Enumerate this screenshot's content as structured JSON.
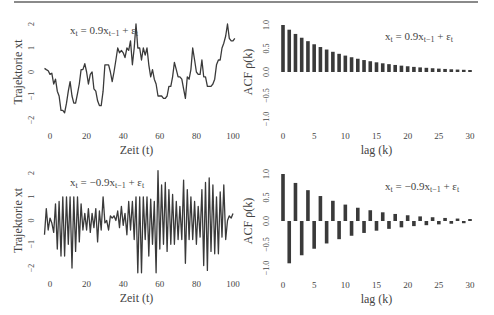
{
  "page": {
    "rule_color": "#8a8a8a",
    "line_color": "#3a3a3a",
    "bar_color": "#3a3a3a"
  },
  "chart_data": [
    {
      "type": "line",
      "title": "x_t = 0.9x_{t−1} + ε_t",
      "annotation": "xt = 0.9xt−1 + εt",
      "xlabel": "Zeit (t)",
      "ylabel": "Trajektorie xt",
      "xticks": [
        0,
        20,
        40,
        60,
        80,
        100
      ],
      "yticks": [
        -2,
        -1,
        0,
        1,
        2
      ],
      "xlim": [
        -5,
        105
      ],
      "ylim": [
        -2.2,
        2.2
      ],
      "x": [
        -3,
        -2,
        -1,
        0,
        1,
        2,
        3,
        4,
        5,
        6,
        7,
        8,
        9,
        10,
        11,
        12,
        13,
        14,
        15,
        16,
        17,
        18,
        19,
        20,
        21,
        22,
        23,
        24,
        25,
        26,
        27,
        28,
        29,
        30,
        31,
        32,
        33,
        34,
        35,
        36,
        37,
        38,
        39,
        40,
        41,
        42,
        43,
        44,
        45,
        46,
        47,
        48,
        49,
        50,
        51,
        52,
        53,
        54,
        55,
        56,
        57,
        58,
        59,
        60,
        61,
        62,
        63,
        64,
        65,
        66,
        67,
        68,
        69,
        70,
        71,
        72,
        73,
        74,
        75,
        76,
        77,
        78,
        79,
        80,
        81,
        82,
        83,
        84,
        85,
        86,
        87,
        88,
        89,
        90,
        91,
        92,
        93,
        94,
        95,
        96,
        97,
        98,
        99,
        100,
        101,
        102,
        103,
        104
      ],
      "values": [
        0.15,
        0.1,
        0.05,
        -0.1,
        -0.05,
        -0.5,
        -0.3,
        -0.8,
        -1.0,
        -1.6,
        -1.6,
        -1.7,
        -1.3,
        -0.8,
        -0.4,
        -1.0,
        -1.3,
        -1.3,
        -0.9,
        -0.5,
        0.1,
        0.1,
        0.35,
        0.0,
        -0.5,
        -0.1,
        0.0,
        -0.7,
        -0.8,
        -1.2,
        -1.4,
        -1.4,
        -0.8,
        0.3,
        0.3,
        0.3,
        0.0,
        -0.4,
        0.0,
        0.5,
        1.0,
        0.8,
        0.9,
        0.8,
        0.6,
        1.0,
        0.9,
        1.3,
        0.3,
        1.0,
        2.0,
        1.0,
        1.0,
        0.5,
        1.0,
        0.7,
        1.0,
        0.3,
        -0.2,
        0.1,
        -0.3,
        -0.5,
        -1.0,
        -1.0,
        -1.0,
        -1.1,
        -1.1,
        -1.0,
        -0.6,
        -0.6,
        -0.2,
        0.4,
        0.1,
        -0.2,
        -0.2,
        -0.3,
        -0.7,
        -1.1,
        -0.2,
        -0.3,
        0.1,
        1.0,
        0.5,
        0.0,
        -0.1,
        -0.1,
        0.5,
        -0.2,
        -0.2,
        -0.6,
        -0.6,
        -0.6,
        -0.5,
        -0.3,
        0.3,
        0.5,
        0.5,
        1.0,
        1.2,
        1.5,
        2.0,
        1.4,
        1.3,
        1.3,
        1.4
      ]
    },
    {
      "type": "bar",
      "title": "x_t = 0.9x_{t−1} + ε_t",
      "annotation": "xt = 0.9xt−1 + εt",
      "xlabel": "lag  (k)",
      "ylabel": "ACF ρ(k)",
      "xticks": [
        0,
        5,
        10,
        15,
        20,
        25,
        30
      ],
      "yticks": [
        -1.0,
        -0.5,
        0.0,
        0.5,
        1.0
      ],
      "xlim": [
        0,
        30
      ],
      "ylim": [
        -1.0,
        1.0
      ],
      "categories": [
        0,
        1,
        2,
        3,
        4,
        5,
        6,
        7,
        8,
        9,
        10,
        11,
        12,
        13,
        14,
        15,
        16,
        17,
        18,
        19,
        20,
        21,
        22,
        23,
        24,
        25,
        26,
        27,
        28,
        29,
        30
      ],
      "values": [
        1.0,
        0.9,
        0.81,
        0.729,
        0.656,
        0.59,
        0.531,
        0.478,
        0.43,
        0.387,
        0.349,
        0.314,
        0.282,
        0.254,
        0.229,
        0.206,
        0.185,
        0.167,
        0.15,
        0.135,
        0.122,
        0.109,
        0.098,
        0.089,
        0.08,
        0.072,
        0.065,
        0.058,
        0.052,
        0.047,
        0.042
      ]
    },
    {
      "type": "line",
      "title": "x_t = −0.9x_{t−1} + ε_t",
      "annotation": "xt = −0.9xt−1 + εt",
      "xlabel": "Zeit (t)",
      "ylabel": "Trajektorie xt",
      "xticks": [
        0,
        20,
        40,
        60,
        80,
        100
      ],
      "yticks": [
        -2,
        -1,
        0,
        1,
        2
      ],
      "xlim": [
        -5,
        105
      ],
      "ylim": [
        -2.2,
        2.2
      ],
      "x": [
        -3,
        -2,
        -1,
        0,
        1,
        2,
        3,
        4,
        5,
        6,
        7,
        8,
        9,
        10,
        11,
        12,
        13,
        14,
        15,
        16,
        17,
        18,
        19,
        20,
        21,
        22,
        23,
        24,
        25,
        26,
        27,
        28,
        29,
        30,
        31,
        32,
        33,
        34,
        35,
        36,
        37,
        38,
        39,
        40,
        41,
        42,
        43,
        44,
        45,
        46,
        47,
        48,
        49,
        50,
        51,
        52,
        53,
        54,
        55,
        56,
        57,
        58,
        59,
        60,
        61,
        62,
        63,
        64,
        65,
        66,
        67,
        68,
        69,
        70,
        71,
        72,
        73,
        74,
        75,
        76,
        77,
        78,
        79,
        80,
        81,
        82,
        83,
        84,
        85,
        86,
        87,
        88,
        89,
        90,
        91,
        92,
        93,
        94,
        95,
        96,
        97,
        98,
        99,
        100,
        101,
        102,
        103,
        104
      ],
      "values": [
        -0.6,
        0.5,
        -0.4,
        0.1,
        -0.1,
        -0.5,
        0.7,
        -1.2,
        0.8,
        -1.5,
        1.0,
        -1.5,
        1.0,
        -1.0,
        1.0,
        -2.0,
        1.0,
        -1.3,
        1.0,
        -0.9,
        0.7,
        -0.4,
        0.3,
        -0.4,
        0.5,
        -0.5,
        0.3,
        -0.3,
        0.5,
        -0.9,
        0.4,
        -0.4,
        1.0,
        -0.1,
        0.0,
        -0.4,
        0.2,
        0.1,
        0.2,
        0.0,
        0.4,
        -0.3,
        0.6,
        -0.2,
        0.3,
        -0.6,
        0.8,
        -0.4,
        0.8,
        -0.8,
        1.0,
        -2.2,
        1.0,
        -2.2,
        1.0,
        -0.8,
        1.0,
        -1.5,
        0.9,
        -1.0,
        0.8,
        -2.2,
        2.1,
        -1.2,
        1.5,
        -1.0,
        1.6,
        -1.3,
        1.3,
        -1.0,
        1.1,
        -1.0,
        0.8,
        -0.8,
        0.6,
        -0.8,
        1.7,
        -1.8,
        1.3,
        -0.8,
        1.0,
        -0.8,
        0.8,
        -1.0,
        0.6,
        -0.7,
        1.3,
        -1.9,
        1.6,
        -2.1,
        1.8,
        -1.3,
        1.5,
        -1.4,
        1.0,
        -1.4,
        1.2,
        -0.7,
        1.5,
        -0.8,
        0.0,
        0.2,
        0.1,
        0.3
      ]
    },
    {
      "type": "bar",
      "title": "x_t = −0.9x_{t−1} + ε_t",
      "annotation": "xt = −0.9xt−1 + εt",
      "xlabel": "lag  (k)",
      "ylabel": "ACF ρ(k)",
      "xticks": [
        0,
        5,
        10,
        15,
        20,
        25,
        30
      ],
      "yticks": [
        -1.0,
        -0.5,
        0.0,
        0.5,
        1.0
      ],
      "xlim": [
        0,
        30
      ],
      "ylim": [
        -1.0,
        1.0
      ],
      "categories": [
        0,
        1,
        2,
        3,
        4,
        5,
        6,
        7,
        8,
        9,
        10,
        11,
        12,
        13,
        14,
        15,
        16,
        17,
        18,
        19,
        20,
        21,
        22,
        23,
        24,
        25,
        26,
        27,
        28,
        29,
        30
      ],
      "values": [
        1.0,
        -0.9,
        0.81,
        -0.729,
        0.656,
        -0.59,
        0.531,
        -0.478,
        0.43,
        -0.387,
        0.349,
        -0.314,
        0.282,
        -0.254,
        0.229,
        -0.206,
        0.185,
        -0.167,
        0.15,
        -0.135,
        0.122,
        -0.109,
        0.098,
        -0.089,
        0.08,
        -0.072,
        0.065,
        -0.058,
        0.052,
        -0.047,
        0.042
      ]
    }
  ]
}
